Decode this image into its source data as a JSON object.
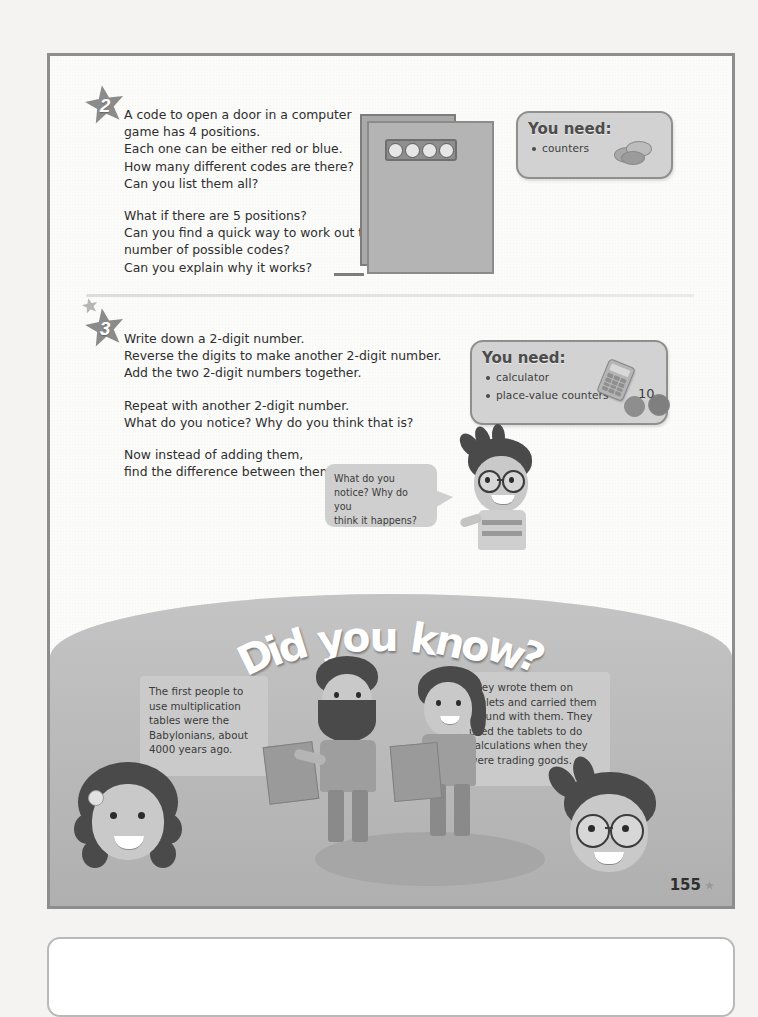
{
  "page": {
    "number": "155",
    "star_icon": "star-icon"
  },
  "activities": [
    {
      "badge": "2",
      "lines_group1": [
        "A code to open a door in a computer",
        "game has 4 positions.",
        "Each one can be either red or blue.",
        "How many different codes are there?",
        "Can you list them all?"
      ],
      "lines_group2": [
        "What if there are 5 positions?",
        "Can you find a quick way to work out the",
        "number of possible codes?",
        "Can you explain why it works?"
      ],
      "you_need": {
        "title": "You need:",
        "items": [
          "counters"
        ]
      },
      "illustration": "computer-game-door-with-4-position-keypad"
    },
    {
      "badge": "3",
      "lines_group1": [
        "Write down a 2-digit number.",
        "Reverse the digits to make another 2-digit number.",
        "Add the two 2-digit numbers together."
      ],
      "lines_group2": [
        "Repeat with another 2-digit number.",
        "What do you notice? Why do you think that is?"
      ],
      "lines_group3": [
        "Now instead of adding them,",
        "find the difference between them."
      ],
      "you_need": {
        "title": "You need:",
        "items": [
          "calculator",
          "place-value counters"
        ]
      },
      "speech_bubble": [
        "What do you",
        "notice? Why do you",
        "think it happens?"
      ],
      "counter_label": "10"
    }
  ],
  "did_you_know": {
    "title": "Did you know?",
    "title_chars": [
      "D",
      "i",
      "d",
      " ",
      "y",
      "o",
      "u",
      " ",
      "k",
      "n",
      "o",
      "w",
      "?"
    ],
    "fact_left": [
      "The first people to",
      "use multiplication",
      "tables were the",
      "Babylonians, about",
      "4000 years ago."
    ],
    "fact_right": [
      "They wrote them on",
      "tablets and carried them",
      "around with them. They",
      "used the tablets to do",
      "calculations when they",
      "were trading goods."
    ],
    "characters": [
      "babylonian-man-with-beard-holding-tablet",
      "babylonian-woman-holding-tablet",
      "girl-with-curly-hair",
      "boy-with-glasses"
    ]
  },
  "colors": {
    "page_background": "#fbfbfa",
    "frame_border": "#8d8d8d",
    "band_background": "#b9b9b9",
    "box_fill": "#d2d2d2",
    "box_border": "#8f8f8f",
    "text": "#2e2e2e"
  }
}
